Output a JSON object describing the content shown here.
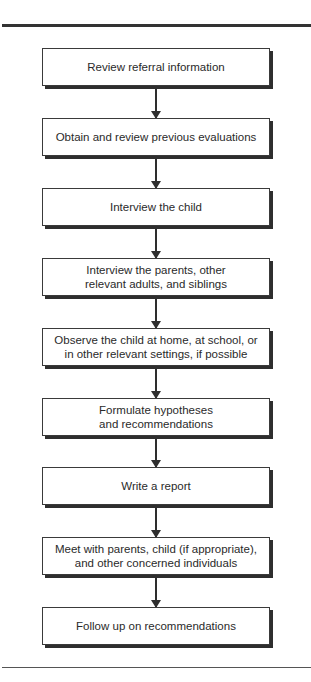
{
  "diagram": {
    "type": "flowchart",
    "direction": "top-to-bottom",
    "steps": [
      {
        "label": "Review referral information"
      },
      {
        "label": "Obtain and review previous evaluations"
      },
      {
        "label": "Interview the child"
      },
      {
        "label": "Interview the parents, other\nrelevant adults, and siblings"
      },
      {
        "label": "Observe the child at home, at school, or\nin other relevant settings, if possible"
      },
      {
        "label": "Formulate hypotheses\nand recommendations"
      },
      {
        "label": "Write a report"
      },
      {
        "label": "Meet with parents, child (if appropriate),\nand other concerned individuals"
      },
      {
        "label": "Follow up on recommendations"
      }
    ],
    "connectors": [
      {
        "from": 0,
        "to": 1,
        "icon": "arrow-down-icon"
      },
      {
        "from": 1,
        "to": 2,
        "icon": "arrow-down-icon"
      },
      {
        "from": 2,
        "to": 3,
        "icon": "arrow-down-icon"
      },
      {
        "from": 3,
        "to": 4,
        "icon": "arrow-down-icon"
      },
      {
        "from": 4,
        "to": 5,
        "icon": "arrow-down-icon"
      },
      {
        "from": 5,
        "to": 6,
        "icon": "arrow-down-icon"
      },
      {
        "from": 6,
        "to": 7,
        "icon": "arrow-down-icon"
      },
      {
        "from": 7,
        "to": 8,
        "icon": "arrow-down-icon"
      }
    ],
    "colors": {
      "line": "#2e2e2e",
      "box_fill": "#ffffff",
      "text": "#2a2a2a"
    }
  }
}
